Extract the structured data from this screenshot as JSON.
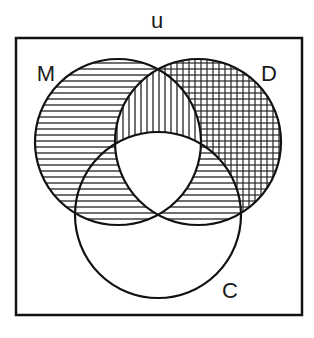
{
  "diagram": {
    "type": "venn",
    "universe": {
      "label": "u",
      "frame": {
        "x": 16,
        "y": 38,
        "width": 286,
        "height": 277
      }
    },
    "sets": [
      {
        "id": "M",
        "label": "M",
        "cx": 118,
        "cy": 142,
        "r": 83,
        "label_x": 44,
        "label_y": 80
      },
      {
        "id": "D",
        "label": "D",
        "cx": 198,
        "cy": 142,
        "r": 83,
        "label_x": 264,
        "label_y": 80
      },
      {
        "id": "C",
        "label": "C",
        "cx": 158,
        "cy": 215,
        "r": 83,
        "label_x": 226,
        "label_y": 297
      }
    ],
    "regions": [
      {
        "name": "M only",
        "shading": "horizontal-lines"
      },
      {
        "name": "D only",
        "shading": "grid"
      },
      {
        "name": "C only",
        "shading": "none"
      },
      {
        "name": "M and D only",
        "shading": "vertical-lines"
      },
      {
        "name": "M and C only",
        "shading": "horizontal-lines"
      },
      {
        "name": "D and C only",
        "shading": "horizontal-lines"
      },
      {
        "name": "M and D and C",
        "shading": "none"
      }
    ],
    "colors": {
      "stroke": "#111111",
      "hatch": "#222222",
      "background": "#ffffff"
    },
    "hatch_spacing": 6
  }
}
